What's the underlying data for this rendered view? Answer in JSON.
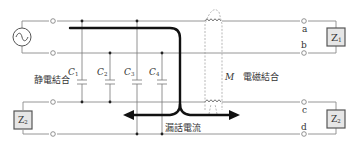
{
  "diagram": {
    "type": "crosstalk-coupling-circuit",
    "labels": {
      "capacitive_coupling": "静電結合",
      "electromagnetic_coupling": "電磁結合",
      "leakage_current": "漏話電流",
      "mutual_inductance": "M",
      "capacitors": [
        "C",
        "C",
        "C",
        "C"
      ],
      "capacitor_subscripts": [
        "1",
        "2",
        "3",
        "4"
      ],
      "terminals": {
        "a": "a",
        "b": "b",
        "c": "c",
        "d": "d"
      },
      "impedances": {
        "z1_main": "Z",
        "z1_sub": "1",
        "z2_left_main": "Z",
        "z2_left_sub": "2",
        "z2_right_main": "Z",
        "z2_right_sub": "2"
      }
    },
    "source": {
      "symbol": "ac-source"
    },
    "colors": {
      "wire": "#8a8a8a",
      "current_path": "#111111",
      "box_fill": "#e6e6e6",
      "box_stroke": "#555555",
      "dashed": "#9a9a9a"
    }
  }
}
